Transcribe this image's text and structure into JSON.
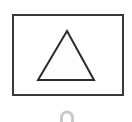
{
  "figure": {
    "title": "Triangle inside rectangle with arch below",
    "background_color": "#ffffff",
    "width": 132,
    "height": 122,
    "caption": ""
  },
  "shapes": {
    "frame": {
      "label": "rectangle",
      "stroke_color": "#3a3a3c",
      "fill_color": "#ffffff",
      "stroke_width": 2,
      "x": 13,
      "y": 15,
      "width": 110,
      "height": 80
    },
    "triangle": {
      "label": "triangle",
      "stroke_color": "#2b2b2d",
      "fill_color": "#fdfdfd",
      "stroke_width": 2,
      "apex_x": 67,
      "apex_y": 31,
      "left_x": 38,
      "left_y": 80,
      "right_x": 94,
      "right_y": 80
    },
    "arch": {
      "label": "arch",
      "stroke_color": "#c9c9c9",
      "fill_color": "none",
      "stroke_width": 3,
      "center_x": 67,
      "baseline_y": 122,
      "radius": 5.5
    }
  }
}
